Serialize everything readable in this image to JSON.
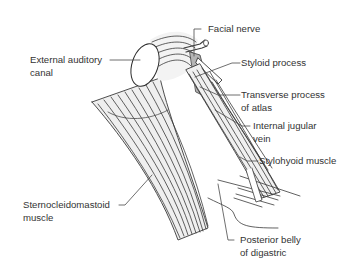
{
  "figure": {
    "colors": {
      "line": "#3a3a3a",
      "muscle_fill": "#ececec",
      "shaded_fill": "#b5b5b5",
      "text": "#333333"
    },
    "labels": {
      "external_auditory_canal": {
        "line1": "External auditory",
        "line2": "canal"
      },
      "facial_nerve": {
        "line1": "Facial nerve"
      },
      "styloid_process": {
        "line1": "Styloid process"
      },
      "transverse_process_atlas": {
        "line1": "Transverse process",
        "line2": "of atlas"
      },
      "internal_jugular_vein": {
        "line1": "Internal jugular",
        "line2": "vein"
      },
      "stylohyoid_muscle": {
        "line1": "Stylohyoid muscle"
      },
      "sternocleidomastoid_muscle": {
        "line1": "Sternocleidomastoid",
        "line2": "muscle"
      },
      "posterior_belly_digastric": {
        "line1": "Posterior belly",
        "line2": "of digastric"
      }
    }
  }
}
